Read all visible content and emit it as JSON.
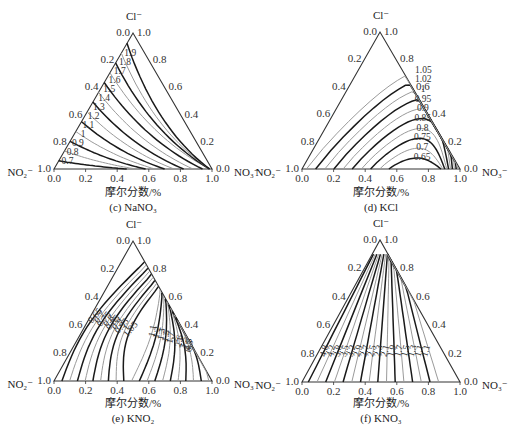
{
  "chart_data": [
    {
      "type": "ternary-contour",
      "panel": "(c)",
      "title": "NaNO3",
      "caption": "(c) NaNO₃",
      "xlabel": "摩尔分数/%",
      "vertices": {
        "top": "Cl⁻",
        "left": "NO₂⁻",
        "right": "NO₃⁻"
      },
      "ticks": [
        "0.0",
        "0.2",
        "0.4",
        "0.6",
        "0.8",
        "1.0"
      ],
      "contour_levels": [
        0.7,
        0.8,
        0.9,
        1.0,
        1.1,
        1.2,
        1.3,
        1.4,
        1.5,
        1.6,
        1.7,
        1.8,
        1.9
      ]
    },
    {
      "type": "ternary-contour",
      "panel": "(d)",
      "title": "KCl",
      "caption": "(d) KCl",
      "xlabel": "摩尔分数/%",
      "vertices": {
        "top": "Cl⁻",
        "left": "NO₂⁻",
        "right": "NO₃⁻"
      },
      "ticks": [
        "0.0",
        "0.2",
        "0.4",
        "0.6",
        "0.8",
        "1.0"
      ],
      "contour_levels": [
        0.65,
        0.7,
        0.75,
        0.8,
        0.85,
        0.9,
        0.95,
        1.0,
        1.02,
        1.05
      ]
    },
    {
      "type": "ternary-contour",
      "panel": "(e)",
      "title": "KNO2",
      "caption": "(e) KNO₂",
      "xlabel": "摩尔分数/%",
      "vertices": {
        "top": "Cl⁻",
        "left": "NO₂⁻",
        "right": "NO₃⁻"
      },
      "ticks": [
        "0.0",
        "0.2",
        "0.4",
        "0.6",
        "0.8",
        "1.0"
      ],
      "contour_levels": [
        0.65,
        0.7,
        0.75,
        0.8,
        0.85,
        0.9,
        0.95,
        1.0,
        1.05,
        1.1,
        1.2,
        1.3,
        1.5,
        1.7,
        2.0,
        2.6,
        3.5,
        4.5,
        6.5,
        9.0
      ]
    },
    {
      "type": "ternary-contour",
      "panel": "(f)",
      "title": "KNO3",
      "caption": "(f) KNO₃",
      "xlabel": "摩尔分数/%",
      "vertices": {
        "top": "Cl⁻",
        "left": "NO₂⁻",
        "right": "NO₃⁻"
      },
      "ticks": [
        "0.0",
        "0.2",
        "0.4",
        "0.6",
        "0.8",
        "1.0"
      ],
      "contour_levels": [
        1.1,
        1.1,
        1.3,
        1.5,
        1.7,
        1.9,
        2.1,
        2.3,
        2.5,
        2.7,
        2.9,
        3.2,
        3.5,
        3.8,
        4.2,
        4.8
      ]
    }
  ],
  "panels": [
    {
      "caption": "(c) NaNO₃",
      "xlabel": "摩尔分数/%",
      "top": "Cl⁻",
      "left": "NO₂⁻",
      "right": "NO₃⁻"
    },
    {
      "caption": "(d) KCl",
      "xlabel": "摩尔分数/%",
      "top": "Cl⁻",
      "left": "NO₂⁻",
      "right": "NO₃⁻"
    },
    {
      "caption": "(e) KNO₂",
      "xlabel": "摩尔分数/%",
      "top": "Cl⁻",
      "left": "NO₂⁻",
      "right": "NO₃⁻"
    },
    {
      "caption": "(f) KNO₃",
      "xlabel": "摩尔分数/%",
      "top": "Cl⁻",
      "left": "NO₂⁻",
      "right": "NO₃⁻"
    }
  ]
}
